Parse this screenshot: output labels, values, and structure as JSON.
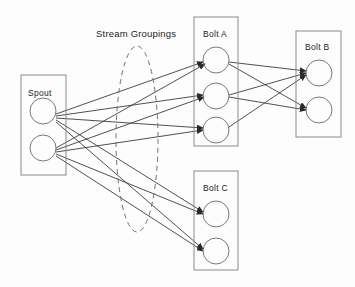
{
  "diagram": {
    "background_color": "#fdfdfd",
    "line_color": "#3c3c3c",
    "box_stroke_color": "#8a8a8a",
    "node_stroke_color": "#7a7a7a",
    "dashed_stroke_color": "#6e6e6e",
    "text_color": "#1c1c1c",
    "annotations": [
      {
        "id": "stream-groupings",
        "label": "Stream Groupings",
        "x": 96,
        "y": 37
      }
    ],
    "groups": [
      {
        "id": "spout",
        "label": "Spout",
        "label_x": 28,
        "label_y": 96,
        "x": 21,
        "y": 75,
        "width": 45,
        "height": 100,
        "nodes": [
          {
            "id": "spout-node-1",
            "cx": 43,
            "cy": 111,
            "r": 13
          },
          {
            "id": "spout-node-2",
            "cx": 43,
            "cy": 148,
            "r": 13
          }
        ]
      },
      {
        "id": "bolt-a",
        "label": "Bolt A",
        "label_x": 203,
        "label_y": 37,
        "x": 194,
        "y": 17,
        "width": 44,
        "height": 129,
        "nodes": [
          {
            "id": "bolt-a-node-1",
            "cx": 216,
            "cy": 60,
            "r": 13
          },
          {
            "id": "bolt-a-node-2",
            "cx": 216,
            "cy": 96,
            "r": 13
          },
          {
            "id": "bolt-a-node-3",
            "cx": 216,
            "cy": 130,
            "r": 13
          }
        ]
      },
      {
        "id": "bolt-b",
        "label": "Bolt B",
        "label_x": 305,
        "label_y": 50,
        "x": 296,
        "y": 31,
        "width": 45,
        "height": 106,
        "nodes": [
          {
            "id": "bolt-b-node-1",
            "cx": 319,
            "cy": 73,
            "r": 13
          },
          {
            "id": "bolt-b-node-2",
            "cx": 319,
            "cy": 110,
            "r": 13
          }
        ]
      },
      {
        "id": "bolt-c",
        "label": "Bolt C",
        "label_x": 203,
        "label_y": 191,
        "x": 194,
        "y": 171,
        "width": 44,
        "height": 99,
        "nodes": [
          {
            "id": "bolt-c-node-1",
            "cx": 216,
            "cy": 214,
            "r": 13
          },
          {
            "id": "bolt-c-node-2",
            "cx": 216,
            "cy": 251,
            "r": 13
          }
        ]
      }
    ],
    "stream_grouping_region": {
      "id": "stream-grouping-ellipse",
      "cx": 137,
      "cy": 139,
      "rx": 21,
      "ry": 93,
      "dashed": true
    },
    "edges": [
      {
        "id": "e1",
        "from": "spout-node-1",
        "to": "bolt-a-node-1",
        "x1": 56,
        "y1": 114,
        "x2": 203,
        "y2": 62
      },
      {
        "id": "e2",
        "from": "spout-node-1",
        "to": "bolt-a-node-2",
        "x1": 56,
        "y1": 116,
        "x2": 203,
        "y2": 95
      },
      {
        "id": "e3",
        "from": "spout-node-1",
        "to": "bolt-a-node-3",
        "x1": 56,
        "y1": 118,
        "x2": 203,
        "y2": 128
      },
      {
        "id": "e4",
        "from": "spout-node-1",
        "to": "bolt-c-node-1",
        "x1": 56,
        "y1": 120,
        "x2": 203,
        "y2": 212
      },
      {
        "id": "e5",
        "from": "spout-node-1",
        "to": "bolt-c-node-2",
        "x1": 56,
        "y1": 122,
        "x2": 203,
        "y2": 249
      },
      {
        "id": "e6",
        "from": "spout-node-2",
        "to": "bolt-a-node-1",
        "x1": 56,
        "y1": 148,
        "x2": 205,
        "y2": 64
      },
      {
        "id": "e7",
        "from": "spout-node-2",
        "to": "bolt-a-node-2",
        "x1": 56,
        "y1": 150,
        "x2": 204,
        "y2": 97
      },
      {
        "id": "e8",
        "from": "spout-node-2",
        "to": "bolt-a-node-3",
        "x1": 56,
        "y1": 152,
        "x2": 203,
        "y2": 130
      },
      {
        "id": "e9",
        "from": "spout-node-2",
        "to": "bolt-c-node-1",
        "x1": 56,
        "y1": 154,
        "x2": 203,
        "y2": 214
      },
      {
        "id": "e10",
        "from": "spout-node-2",
        "to": "bolt-c-node-2",
        "x1": 56,
        "y1": 156,
        "x2": 203,
        "y2": 251
      },
      {
        "id": "e11",
        "from": "bolt-a-node-1",
        "to": "bolt-b-node-1",
        "x1": 229,
        "y1": 62,
        "x2": 306,
        "y2": 71
      },
      {
        "id": "e12",
        "from": "bolt-a-node-1",
        "to": "bolt-b-node-2",
        "x1": 229,
        "y1": 64,
        "x2": 306,
        "y2": 108
      },
      {
        "id": "e13",
        "from": "bolt-a-node-2",
        "to": "bolt-b-node-1",
        "x1": 229,
        "y1": 95,
        "x2": 306,
        "y2": 73
      },
      {
        "id": "e14",
        "from": "bolt-a-node-2",
        "to": "bolt-b-node-2",
        "x1": 229,
        "y1": 97,
        "x2": 306,
        "y2": 110
      },
      {
        "id": "e15",
        "from": "bolt-a-node-3",
        "to": "bolt-b-node-1",
        "x1": 229,
        "y1": 127,
        "x2": 306,
        "y2": 75
      }
    ]
  }
}
